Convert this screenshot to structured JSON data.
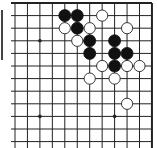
{
  "board": {
    "type": "go-diagram",
    "visible_cols": 12,
    "visible_rows": 12,
    "edges": {
      "top": true,
      "right": true,
      "left": false,
      "bottom": false
    },
    "colors": {
      "line": "#222222",
      "black": "#111111",
      "white": "#ffffff",
      "background": "#ffffff"
    },
    "star_points": [
      [
        2,
        3
      ],
      [
        2,
        9
      ],
      [
        8,
        9
      ]
    ],
    "black_stones": [
      [
        4,
        1
      ],
      [
        5,
        1
      ],
      [
        5,
        2
      ],
      [
        6,
        3
      ],
      [
        6,
        4
      ],
      [
        8,
        3
      ],
      [
        8,
        4
      ],
      [
        9,
        4
      ],
      [
        8,
        5
      ]
    ],
    "white_stones": [
      [
        7,
        1
      ],
      [
        4,
        2
      ],
      [
        6,
        2
      ],
      [
        9,
        2
      ],
      [
        5,
        3
      ],
      [
        7,
        5
      ],
      [
        9,
        5
      ],
      [
        10,
        5
      ],
      [
        6,
        6
      ],
      [
        8,
        6
      ],
      [
        9,
        8
      ]
    ]
  }
}
